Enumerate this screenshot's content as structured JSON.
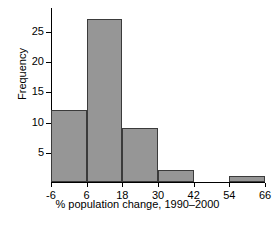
{
  "chart_data": {
    "type": "bar",
    "title": "",
    "xlabel": "% population change, 1990–2000",
    "ylabel": "Frequency",
    "bin_edges": [
      -6,
      6,
      18,
      30,
      42,
      54,
      66
    ],
    "categories": [
      "-6 to 6",
      "6 to 18",
      "18 to 30",
      "30 to 42",
      "42 to 54",
      "54 to 66"
    ],
    "values": [
      12,
      27,
      9,
      2,
      0,
      1
    ],
    "xticks": [
      "-6",
      "6",
      "18",
      "30",
      "42",
      "54",
      "66"
    ],
    "xtick_values": [
      -6,
      6,
      18,
      30,
      42,
      54,
      66
    ],
    "yticks": [
      "5",
      "10",
      "15",
      "20",
      "25"
    ],
    "ytick_values": [
      5,
      10,
      15,
      20,
      25
    ],
    "xlim": [
      -6,
      66
    ],
    "ylim": [
      0,
      29
    ],
    "grid": false,
    "legend": null,
    "bar_fill_color": "#969696",
    "bar_edge_color": "#3b3b3b",
    "axis_color": "#000000",
    "background_color": "#ffffff"
  }
}
